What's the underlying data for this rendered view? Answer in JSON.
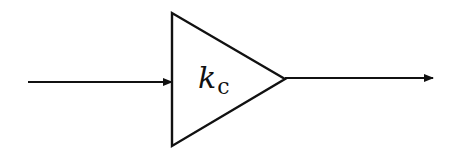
{
  "diagram": {
    "type": "block-diagram",
    "block": {
      "shape": "triangle",
      "role": "gain",
      "label_main": "k",
      "label_sub": "c"
    },
    "input_arrow": {
      "direction": "right"
    },
    "output_arrow": {
      "direction": "right"
    },
    "colors": {
      "stroke": "#111111",
      "background": "#ffffff"
    }
  }
}
